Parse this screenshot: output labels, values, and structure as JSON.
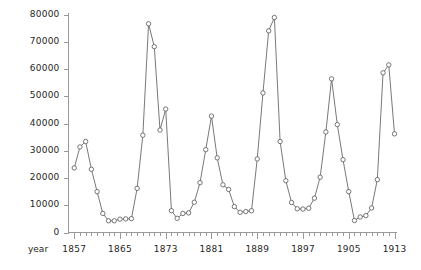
{
  "chart_data": {
    "type": "line",
    "title": "",
    "subtitle": "",
    "xlabel": "year",
    "ylabel": "",
    "grid": false,
    "legend": false,
    "marker": "open-circle",
    "line_color": "#555555",
    "marker_color": "#555555",
    "background_color": "#ffffff",
    "axis_color": "#999999",
    "xlim": [
      1856,
      1913
    ],
    "ylim": [
      0,
      80000
    ],
    "x_tick_labels": [
      "1857",
      "1865",
      "1873",
      "1881",
      "1889",
      "1897",
      "1905",
      "1913"
    ],
    "x_tick_values": [
      1857,
      1865,
      1873,
      1881,
      1889,
      1897,
      1905,
      1913
    ],
    "x_minor_tick_step": 1,
    "y_tick_labels": [
      "0",
      "10000",
      "20000",
      "30000",
      "40000",
      "50000",
      "60000",
      "70000",
      "80000"
    ],
    "y_tick_values": [
      0,
      10000,
      20000,
      30000,
      40000,
      50000,
      60000,
      70000,
      80000
    ],
    "x": [
      1857,
      1858,
      1859,
      1860,
      1861,
      1862,
      1863,
      1864,
      1865,
      1866,
      1867,
      1868,
      1869,
      1870,
      1871,
      1872,
      1873,
      1874,
      1875,
      1876,
      1877,
      1878,
      1879,
      1880,
      1881,
      1882,
      1883,
      1884,
      1885,
      1886,
      1887,
      1888,
      1889,
      1890,
      1891,
      1892,
      1893,
      1894,
      1895,
      1896,
      1897,
      1898,
      1899,
      1900,
      1901,
      1902,
      1903,
      1904,
      1905,
      1906,
      1907,
      1908,
      1909,
      1910,
      1911
    ],
    "y": [
      23700,
      31400,
      33400,
      23200,
      15000,
      7000,
      4300,
      4300,
      4900,
      5000,
      5100,
      16200,
      35700,
      76600,
      68200,
      37600,
      45300,
      8000,
      5200,
      7000,
      7200,
      11100,
      18300,
      30400,
      42700,
      27400,
      17500,
      15800,
      9500,
      7400,
      7700,
      8000,
      27000,
      51200,
      74000,
      78900,
      33400,
      19000,
      11000,
      8700,
      8600,
      8900,
      12600,
      20300,
      36900,
      56400,
      39600,
      26700,
      15000,
      4400,
      5700,
      6200,
      9000,
      19400,
      58600
    ],
    "y_full": [
      23700,
      31400,
      33400,
      23200,
      15000,
      7000,
      4300,
      4300,
      4900,
      5000,
      5100,
      16200,
      35700,
      76600,
      68200,
      37600,
      45300,
      8000,
      5200,
      7000,
      7200,
      11100,
      18300,
      30400,
      42700,
      27400,
      17500,
      15800,
      9500,
      7400,
      7700,
      8000,
      27000,
      51200,
      74000,
      78900,
      33400,
      19000,
      11000,
      8700,
      8600,
      8900,
      12600,
      20300,
      36900,
      56400,
      39600,
      26700,
      15000,
      4400,
      5700,
      6200,
      9000,
      19400,
      58600
    ],
    "series": [
      {
        "name": "value",
        "points": [
          [
            1857,
            23700
          ],
          [
            1858,
            31400
          ],
          [
            1859,
            33400
          ],
          [
            1860,
            23200
          ],
          [
            1861,
            15000
          ],
          [
            1862,
            7000
          ],
          [
            1863,
            4300
          ],
          [
            1864,
            4300
          ],
          [
            1865,
            4900
          ],
          [
            1866,
            5000
          ],
          [
            1867,
            5100
          ],
          [
            1868,
            16200
          ],
          [
            1869,
            35700
          ],
          [
            1870,
            76600
          ],
          [
            1871,
            68200
          ],
          [
            1872,
            37600
          ],
          [
            1873,
            45300
          ],
          [
            1874,
            8000
          ],
          [
            1875,
            5200
          ],
          [
            1876,
            7000
          ],
          [
            1877,
            7200
          ],
          [
            1878,
            11100
          ],
          [
            1879,
            18300
          ],
          [
            1880,
            30400
          ],
          [
            1881,
            42700
          ],
          [
            1882,
            27400
          ],
          [
            1883,
            17500
          ],
          [
            1884,
            15800
          ],
          [
            1885,
            9500
          ],
          [
            1886,
            7400
          ],
          [
            1887,
            7700
          ],
          [
            1888,
            8000
          ],
          [
            1889,
            27000
          ],
          [
            1890,
            51200
          ],
          [
            1891,
            74000
          ],
          [
            1892,
            78900
          ],
          [
            1893,
            33400
          ],
          [
            1894,
            19000
          ],
          [
            1895,
            11000
          ],
          [
            1896,
            8700
          ],
          [
            1897,
            8600
          ],
          [
            1898,
            8900
          ],
          [
            1899,
            12600
          ],
          [
            1900,
            20300
          ],
          [
            1901,
            36900
          ],
          [
            1902,
            56400
          ],
          [
            1903,
            39600
          ],
          [
            1904,
            26700
          ],
          [
            1905,
            15000
          ],
          [
            1906,
            4400
          ],
          [
            1907,
            5700
          ],
          [
            1908,
            6200
          ],
          [
            1909,
            9000
          ],
          [
            1910,
            19400
          ],
          [
            1911,
            58600
          ],
          [
            1912,
            61500
          ],
          [
            1913,
            36200
          ]
        ]
      }
    ],
    "annotations": []
  },
  "axis": {
    "x_caption": "year"
  }
}
